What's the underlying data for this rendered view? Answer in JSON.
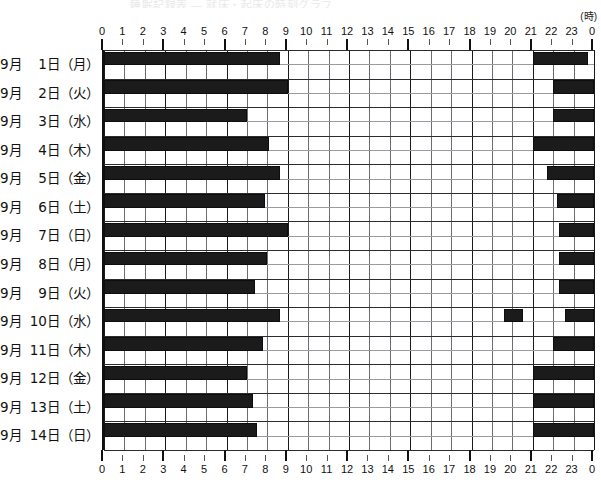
{
  "caption": "睡眠記録表 ― 就床・起床の時刻グラフ",
  "axis": {
    "unit_label": "(時)",
    "hour_ticks": [
      "0",
      "1",
      "2",
      "3",
      "4",
      "5",
      "6",
      "7",
      "8",
      "9",
      "10",
      "11",
      "12",
      "13",
      "14",
      "15",
      "16",
      "17",
      "18",
      "19",
      "20",
      "21",
      "22",
      "23",
      "0"
    ],
    "major_every": 3,
    "range_hours": [
      0,
      24
    ]
  },
  "colors": {
    "bar": "#1b1b1b",
    "grid_minor": "#6c6c72",
    "grid_major": "#1a1a1a",
    "background": "#ffffff",
    "text": "#111111"
  },
  "chart_data": {
    "type": "bar",
    "title": "睡眠記録表 ― 就床・起床の時刻グラフ",
    "xlabel": "(時)",
    "ylabel": "",
    "xlim": [
      0,
      24
    ],
    "grid": true,
    "legend": "none",
    "orientation": "horizontal",
    "categories": [
      "9月  1日（月）",
      "9月  2日（火）",
      "9月  3日（水）",
      "9月  4日（木）",
      "9月  5日（金）",
      "9月  6日（土）",
      "9月  7日（日）",
      "9月  8日（月）",
      "9月  9日（火）",
      "9月 10日（水）",
      "9月 11日（木）",
      "9月 12日（金）",
      "9月 13日（土）",
      "9月 14日（日）"
    ],
    "rows": [
      {
        "label": "9月  1日（月）",
        "month": "9月",
        "day": "1日",
        "dow": "（月）",
        "segments": [
          {
            "start": 0.0,
            "end": 8.6
          },
          {
            "start": 21.0,
            "end": 23.7
          }
        ]
      },
      {
        "label": "9月  2日（火）",
        "month": "9月",
        "day": "2日",
        "dow": "（火）",
        "segments": [
          {
            "start": 0.0,
            "end": 9.0
          },
          {
            "start": 22.0,
            "end": 24.0
          }
        ]
      },
      {
        "label": "9月  3日（水）",
        "month": "9月",
        "day": "3日",
        "dow": "（水）",
        "segments": [
          {
            "start": 0.0,
            "end": 7.0
          },
          {
            "start": 22.0,
            "end": 24.0
          }
        ]
      },
      {
        "label": "9月  4日（木）",
        "month": "9月",
        "day": "4日",
        "dow": "（木）",
        "segments": [
          {
            "start": 0.0,
            "end": 8.1
          },
          {
            "start": 21.0,
            "end": 24.0
          }
        ]
      },
      {
        "label": "9月  5日（金）",
        "month": "9月",
        "day": "5日",
        "dow": "（金）",
        "segments": [
          {
            "start": 0.0,
            "end": 8.6
          },
          {
            "start": 21.7,
            "end": 24.0
          }
        ]
      },
      {
        "label": "9月  6日（土）",
        "month": "9月",
        "day": "6日",
        "dow": "（土）",
        "segments": [
          {
            "start": 0.0,
            "end": 7.9
          },
          {
            "start": 22.2,
            "end": 24.0
          }
        ]
      },
      {
        "label": "9月  7日（日）",
        "month": "9月",
        "day": "7日",
        "dow": "（日）",
        "segments": [
          {
            "start": 0.0,
            "end": 9.0
          },
          {
            "start": 22.3,
            "end": 24.0
          }
        ]
      },
      {
        "label": "9月  8日（月）",
        "month": "9月",
        "day": "8日",
        "dow": "（月）",
        "segments": [
          {
            "start": 0.0,
            "end": 8.0
          },
          {
            "start": 22.3,
            "end": 24.0
          }
        ]
      },
      {
        "label": "9月  9日（火）",
        "month": "9月",
        "day": "9日",
        "dow": "（火）",
        "segments": [
          {
            "start": 0.0,
            "end": 7.4
          },
          {
            "start": 22.3,
            "end": 24.0
          }
        ]
      },
      {
        "label": "9月 10日（水）",
        "month": "9月",
        "day": "10日",
        "dow": "（水）",
        "segments": [
          {
            "start": 0.0,
            "end": 8.6
          },
          {
            "start": 19.6,
            "end": 20.5
          },
          {
            "start": 22.6,
            "end": 24.0
          }
        ]
      },
      {
        "label": "9月 11日（木）",
        "month": "9月",
        "day": "11日",
        "dow": "（木）",
        "segments": [
          {
            "start": 0.0,
            "end": 7.8
          },
          {
            "start": 22.0,
            "end": 24.0
          }
        ]
      },
      {
        "label": "9月 12日（金）",
        "month": "9月",
        "day": "12日",
        "dow": "（金）",
        "segments": [
          {
            "start": 0.0,
            "end": 7.0
          },
          {
            "start": 21.0,
            "end": 24.0
          }
        ]
      },
      {
        "label": "9月 13日（土）",
        "month": "9月",
        "day": "13日",
        "dow": "（土）",
        "segments": [
          {
            "start": 0.0,
            "end": 7.3
          },
          {
            "start": 21.0,
            "end": 24.0
          }
        ]
      },
      {
        "label": "9月 14日（日）",
        "month": "9月",
        "day": "14日",
        "dow": "（日）",
        "segments": [
          {
            "start": 0.0,
            "end": 7.5
          },
          {
            "start": 21.0,
            "end": 24.0
          }
        ]
      }
    ]
  }
}
